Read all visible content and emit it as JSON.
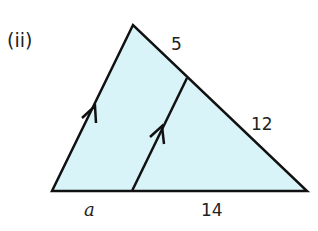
{
  "part_label": "(ii)",
  "colors": {
    "fill": "#d9f4f8",
    "stroke": "#111111",
    "text": "#222222"
  },
  "diagram": {
    "type": "triangle-with-parallel-line",
    "vertices": {
      "apex": [
        133,
        25
      ],
      "bottom_left": [
        52,
        191
      ],
      "bottom_right": [
        307,
        191
      ]
    },
    "parallel_segment": {
      "from": [
        132,
        191
      ],
      "to": [
        187,
        78
      ]
    },
    "parallel_marks": [
      "left-side",
      "inner-segment"
    ]
  },
  "labels": {
    "top_right_segment": "5",
    "lower_right_segment": "12",
    "base_left_segment": "a",
    "base_right_segment": "14"
  }
}
